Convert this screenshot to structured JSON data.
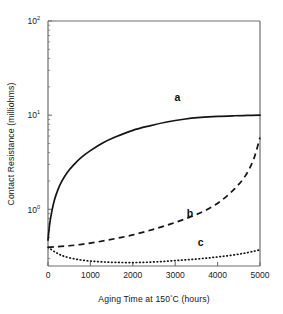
{
  "chart_data": {
    "type": "line",
    "title": "",
    "xlabel": "Aging Time at 150°C  (hours)",
    "ylabel": "Contact Resistance  (milliohms)",
    "xlabel_parts": {
      "pre": "Aging Time at 150",
      "degree": "°",
      "post": "C  (hours)"
    },
    "xlim": [
      0,
      5000
    ],
    "ylim": [
      0.25,
      100
    ],
    "yscale": "log",
    "xscale": "linear",
    "grid": false,
    "legend": "inline-curve-labels",
    "xticks": [
      0,
      1000,
      2000,
      3000,
      4000,
      5000
    ],
    "xticklabels": [
      "0",
      "1000",
      "2000",
      "3000",
      "4000",
      "5000"
    ],
    "yticks": [
      1,
      10,
      100
    ],
    "yticklabels": [
      "10⁰",
      "10¹",
      "10²"
    ],
    "ytick_mantissa": "10",
    "ytick_exponents": [
      "0",
      "1",
      "2"
    ],
    "series": [
      {
        "name": "a",
        "label": "a",
        "style": "solid",
        "label_x": 3050,
        "label_y": 14.0,
        "x": [
          0,
          40,
          90,
          150,
          230,
          330,
          450,
          600,
          800,
          1000,
          1300,
          1600,
          2000,
          2400,
          2800,
          3200,
          3600,
          4000,
          4400,
          4700,
          5000
        ],
        "y": [
          0.47,
          0.7,
          0.95,
          1.25,
          1.6,
          2.0,
          2.45,
          2.95,
          3.6,
          4.2,
          5.1,
          5.9,
          6.9,
          7.7,
          8.45,
          9.05,
          9.45,
          9.7,
          9.85,
          9.93,
          10.0
        ]
      },
      {
        "name": "b",
        "label": "b",
        "style": "dashed",
        "label_x": 3350,
        "label_y": 0.82,
        "x": [
          0,
          200,
          500,
          800,
          1100,
          1400,
          1700,
          2000,
          2300,
          2600,
          2900,
          3200,
          3500,
          3800,
          4100,
          4400,
          4650,
          4850,
          5000
        ],
        "y": [
          0.395,
          0.4,
          0.41,
          0.425,
          0.445,
          0.47,
          0.5,
          0.535,
          0.58,
          0.635,
          0.7,
          0.78,
          0.88,
          1.02,
          1.25,
          1.65,
          2.25,
          3.4,
          5.8
        ]
      },
      {
        "name": "c",
        "label": "c",
        "style": "dotted",
        "label_x": 3600,
        "label_y": 0.405,
        "x": [
          0,
          200,
          400,
          700,
          1000,
          1300,
          1600,
          1900,
          2200,
          2500,
          2800,
          3100,
          3400,
          3700,
          4000,
          4300,
          4600,
          4850,
          5000
        ],
        "y": [
          0.395,
          0.345,
          0.315,
          0.293,
          0.282,
          0.276,
          0.273,
          0.272,
          0.273,
          0.276,
          0.281,
          0.287,
          0.294,
          0.302,
          0.312,
          0.324,
          0.34,
          0.358,
          0.372
        ]
      }
    ]
  }
}
